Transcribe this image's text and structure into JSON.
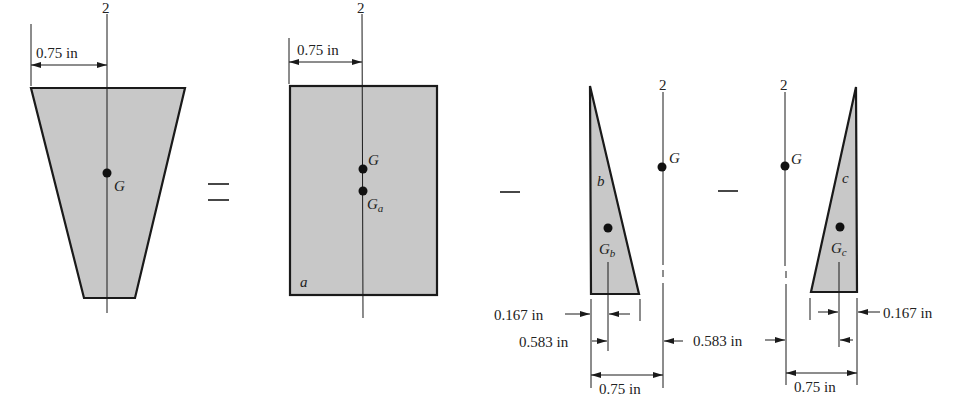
{
  "figure": {
    "operators": {
      "equals": "=",
      "minus1": "−",
      "minus2": "−"
    },
    "panels": {
      "trapezoid": {
        "axis_label": "2",
        "centroid_label": "G",
        "dimension": "0.75 in"
      },
      "rectangle": {
        "axis_label": "2",
        "centroid_label": "G",
        "part_centroid_label": "G",
        "part_centroid_sub": "a",
        "part_label": "a",
        "dimension": "0.75 in"
      },
      "triangle_b": {
        "axis_label": "2",
        "centroid_label": "G",
        "part_centroid_label": "G",
        "part_centroid_sub": "b",
        "part_label": "b",
        "dim_small": "0.167 in",
        "dim_mid": "0.583 in",
        "dim_total": "0.75 in"
      },
      "triangle_c": {
        "axis_label": "2",
        "centroid_label": "G",
        "part_centroid_label": "G",
        "part_centroid_sub": "c",
        "part_label": "c",
        "dim_small": "0.167 in",
        "dim_mid": "0.583 in",
        "dim_total": "0.75 in"
      }
    },
    "colors": {
      "fill": "#c8c8c8",
      "stroke": "#1a1a1a"
    }
  }
}
